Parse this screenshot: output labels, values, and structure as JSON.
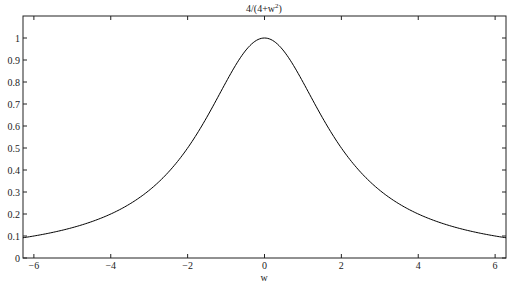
{
  "chart_data": {
    "type": "line",
    "title_base": "4/(4+w",
    "title_sup": "2",
    "title_end": ")",
    "xlabel": "w",
    "ylabel": "",
    "xlim": [
      -6.2832,
      6.2832
    ],
    "ylim": [
      0,
      1.1
    ],
    "xticks": [
      -6,
      -4,
      -2,
      0,
      2,
      4,
      6
    ],
    "xtick_labels": [
      "−6",
      "−4",
      "−2",
      "0",
      "2",
      "4",
      "6"
    ],
    "yticks": [
      0,
      0.1,
      0.2,
      0.3,
      0.4,
      0.5,
      0.6,
      0.7,
      0.8,
      0.9,
      1
    ],
    "ytick_labels": [
      "0",
      "0.1",
      "0.2",
      "0.3",
      "0.4",
      "0.5",
      "0.6",
      "0.7",
      "0.8",
      "0.9",
      "1"
    ],
    "grid": false,
    "legend": null,
    "series": [
      {
        "name": "4/(4+w^2)",
        "color": "#000000",
        "x": [
          -6.2832,
          -6,
          -5,
          -4,
          -3,
          -2.5,
          -2,
          -1.5,
          -1,
          -0.5,
          0,
          0.5,
          1,
          1.5,
          2,
          2.5,
          3,
          4,
          5,
          6,
          6.2832
        ],
        "values": [
          0.092,
          0.1,
          0.138,
          0.2,
          0.308,
          0.39,
          0.5,
          0.64,
          0.8,
          0.941,
          1.0,
          0.941,
          0.8,
          0.64,
          0.5,
          0.39,
          0.308,
          0.2,
          0.138,
          0.1,
          0.092
        ]
      }
    ]
  },
  "caption": "█████ ██████ ████████"
}
